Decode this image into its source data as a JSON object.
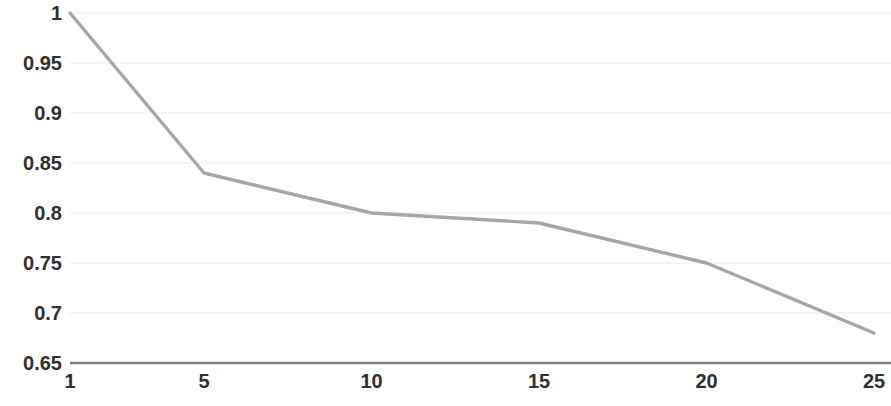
{
  "chart_data": {
    "type": "line",
    "title": "",
    "xlabel": "",
    "ylabel": "",
    "x": [
      1,
      5,
      10,
      15,
      20,
      25
    ],
    "values": [
      1,
      0.84,
      0.8,
      0.79,
      0.75,
      0.68
    ],
    "series": [
      {
        "name": "",
        "values": [
          1,
          0.84,
          0.8,
          0.79,
          0.75,
          0.68
        ]
      }
    ],
    "xlim": [
      1,
      25
    ],
    "ylim": [
      0.65,
      1
    ],
    "x_tick_labels": [
      "1",
      "5",
      "10",
      "15",
      "20",
      "25"
    ],
    "x_tick_values": [
      1,
      5,
      10,
      15,
      20,
      25
    ],
    "y_tick_labels": [
      "1",
      "0.95",
      "0.9",
      "0.85",
      "0.8",
      "0.75",
      "0.7",
      "0.65"
    ],
    "y_tick_values": [
      1,
      0.95,
      0.9,
      0.85,
      0.8,
      0.75,
      0.7,
      0.65
    ],
    "grid": "horizontal",
    "legend": "none",
    "line_color": "#a6a6a6",
    "grid_color": "#f2f2f2",
    "axis_color": "#808080",
    "label_color": "#2f2f2f"
  }
}
